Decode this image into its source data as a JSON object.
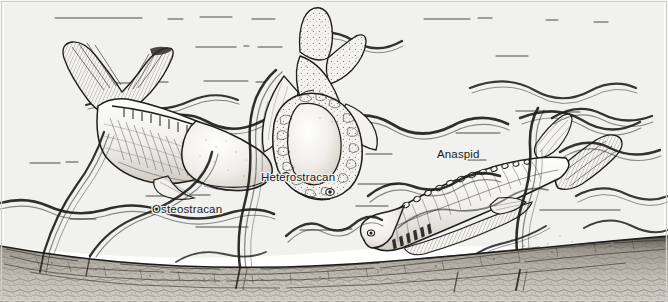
{
  "figure": {
    "medium": "pen-and-ink scientific illustration",
    "scene_description": "Three armoured jawless fishes (ostracoderms) swimming above a pebbly sea bed among ribbon-like seaweed fronds",
    "width_px": 668,
    "height_px": 302
  },
  "palette": {
    "water_background": "#f1f1ef",
    "ink": "#1d1d1b",
    "label_color": "#1a1a1a",
    "seabed_fill": "#b9b5ac",
    "fish_body_fill": "#f6f5f2",
    "frame_border": "#c9c9c6",
    "page_white": "#ffffff"
  },
  "labels": [
    {
      "id": "osteostracan",
      "text": "Osteostracan",
      "x": 152,
      "y": 213,
      "anchor": "start"
    },
    {
      "id": "heterostracan",
      "text": "Heterostracan",
      "x": 261,
      "y": 181,
      "anchor": "start"
    },
    {
      "id": "anaspid",
      "text": "Anaspid",
      "x": 437,
      "y": 158,
      "anchor": "start"
    }
  ],
  "specimens": [
    {
      "id": "osteostracan",
      "common_name": "Osteostracan",
      "label": "Osteostracan",
      "position": "left",
      "orientation": "swimming left-to-right, head lower right, tail upper left",
      "features": "broad bony head shield, ridged scale rows along flank, hypocercal upturned tail, paired pectoral flaps"
    },
    {
      "id": "heterostracan",
      "common_name": "Heterostracan",
      "label": "Heterostracan",
      "position": "centre",
      "orientation": "head-on, rising vertically",
      "features": "tessellated stippled armour plates, large oval head plate, forked hypocercal tail, lateral eye pits"
    },
    {
      "id": "anaspid",
      "common_name": "Anaspid",
      "label": "Anaspid",
      "position": "right",
      "orientation": "swimming right-to-left, head lower left, tail upper right",
      "features": "slender fusiform body, dorsal row of scutes, row of gill openings behind eye, strongly hypocercal tail"
    }
  ],
  "scene_elements": [
    {
      "id": "seabed",
      "name": "sea bed",
      "description": "cracked pebbly substrate band sloping from lower-left up to the right"
    },
    {
      "id": "seaweed",
      "name": "seaweed fronds",
      "description": "long wavy dark ribbon-like algae streaming horizontally through the water"
    },
    {
      "id": "water",
      "name": "open water",
      "description": "pale grey water column with faint horizontal current strokes"
    }
  ]
}
